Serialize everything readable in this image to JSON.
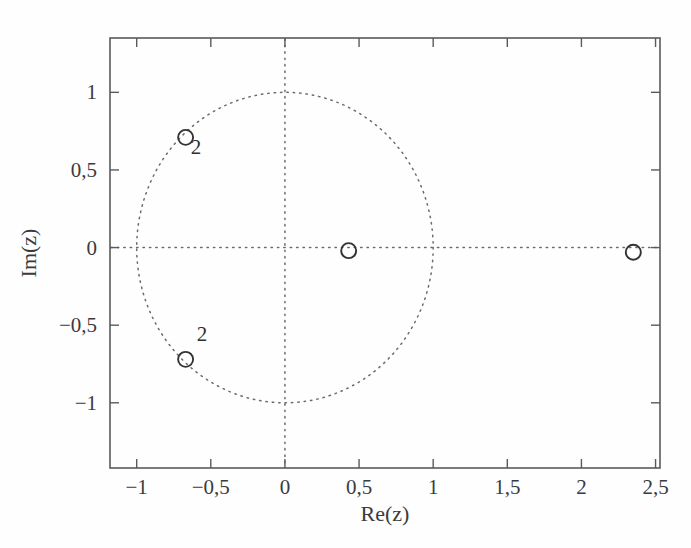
{
  "figure": {
    "background_color": "#fefefe",
    "frame_color": "#5a5a5a",
    "dot_color": "#6b6b6b",
    "marker_color": "#333333",
    "text_color": "#3b3b3b"
  },
  "chart_data": {
    "type": "scatter",
    "title": "",
    "xlabel": "Re(z)",
    "ylabel": "Im(z)",
    "xlim": [
      -1.18,
      2.53
    ],
    "ylim": [
      -1.42,
      1.35
    ],
    "grid": false,
    "legend": null,
    "xticks": [
      -1,
      -0.5,
      0,
      0.5,
      1,
      1.5,
      2,
      2.5
    ],
    "xticklabels": [
      "-1",
      "-0,5",
      "0",
      "0,5",
      "1",
      "1,5",
      "2",
      "2,5"
    ],
    "yticks": [
      -1,
      -0.5,
      0,
      0.5,
      1
    ],
    "yticklabels": [
      "-1",
      "-0,5",
      "0",
      "0,5",
      "1"
    ],
    "annotations": [
      {
        "text": "2",
        "x": -0.6,
        "y": 0.6
      },
      {
        "text": "2",
        "x": -0.56,
        "y": -0.6
      }
    ],
    "reference_shapes": [
      {
        "name": "unit-circle",
        "type": "circle",
        "cx": 0,
        "cy": 0,
        "r": 1,
        "style": "dotted"
      },
      {
        "name": "real-axis",
        "type": "hline",
        "y": 0,
        "style": "dotted"
      },
      {
        "name": "imaginary-axis",
        "type": "vline",
        "x": 0,
        "style": "dotted"
      }
    ],
    "series": [
      {
        "name": "zeros",
        "marker": "o",
        "filled": false,
        "points": [
          {
            "x": -0.67,
            "y": 0.71,
            "multiplicity": "2"
          },
          {
            "x": -0.67,
            "y": -0.72,
            "multiplicity": "2"
          },
          {
            "x": 0.43,
            "y": -0.02,
            "multiplicity": ""
          },
          {
            "x": 2.35,
            "y": -0.03,
            "multiplicity": ""
          }
        ]
      }
    ]
  },
  "labels": {
    "x_axis_title": "Re(z)",
    "y_axis_title": "Im(z)"
  }
}
